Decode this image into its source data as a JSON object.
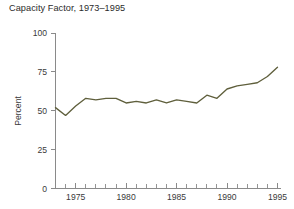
{
  "chart_data": {
    "type": "line",
    "title": "Capacity Factor, 1973–1995",
    "xlabel": "",
    "ylabel": "Percent",
    "xlim": [
      1973,
      1995
    ],
    "ylim": [
      0,
      100
    ],
    "grid": false,
    "legend": null,
    "line_color": "#5f5f3c",
    "axis_color": "#8a8a8a",
    "background": "#ffffff",
    "y_ticks": [
      0,
      25,
      50,
      75,
      100
    ],
    "y_tick_labels": [
      "0",
      "25",
      "50",
      "75",
      "100"
    ],
    "x_ticks_major": [
      1975,
      1980,
      1985,
      1990,
      1995
    ],
    "x_tick_labels": [
      "1975",
      "1980",
      "1985",
      "1990",
      "1995"
    ],
    "x_ticks_minor": [
      1973,
      1974,
      1976,
      1977,
      1978,
      1979,
      1981,
      1982,
      1983,
      1984,
      1986,
      1987,
      1988,
      1989,
      1991,
      1992,
      1993,
      1994
    ],
    "x": [
      1973,
      1974,
      1975,
      1976,
      1977,
      1978,
      1979,
      1980,
      1981,
      1982,
      1983,
      1984,
      1985,
      1986,
      1987,
      1988,
      1989,
      1990,
      1991,
      1992,
      1993,
      1994,
      1995
    ],
    "values": [
      52,
      47,
      53,
      58,
      57,
      58,
      58,
      55,
      56,
      55,
      57,
      55,
      57,
      56,
      55,
      60,
      58,
      64,
      66,
      67,
      68,
      72,
      78
    ],
    "units": "percent"
  }
}
